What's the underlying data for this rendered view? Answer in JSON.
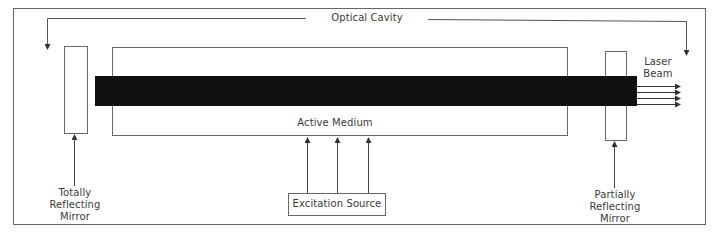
{
  "diagram": {
    "title": "Optical Cavity",
    "labels": {
      "optical_cavity": "Optical Cavity",
      "active_medium": "Active Medium",
      "excitation_source": "Excitation Source",
      "laser_beam_line1": "Laser",
      "laser_beam_line2": "Beam",
      "totally_reflecting_line1": "Totally",
      "totally_reflecting_line2": "Reflecting",
      "totally_reflecting_line3": "Mirror",
      "partially_reflecting_line1": "Partially",
      "partially_reflecting_line2": "Reflecting",
      "partially_reflecting_line3": "Mirror"
    },
    "components": [
      "Totally Reflecting Mirror",
      "Active Medium",
      "Partially Reflecting Mirror",
      "Excitation Source",
      "Laser Beam"
    ],
    "excitation_arrow_count": 3,
    "output_beam_arrow_count": 4,
    "colors": {
      "line": "#555555",
      "beam": "#111111",
      "background": "#ffffff"
    }
  }
}
